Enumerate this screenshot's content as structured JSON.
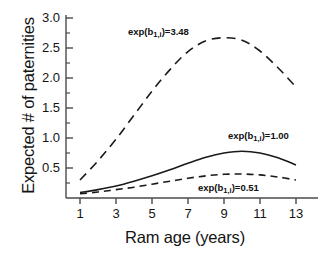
{
  "chart_data": {
    "type": "line",
    "title": "",
    "xlabel": "Ram age (years)",
    "ylabel": "Expected # of paternities",
    "xlim": [
      0.6,
      13.6
    ],
    "ylim": [
      0,
      3.0
    ],
    "xticks": [
      1,
      3,
      5,
      7,
      9,
      11,
      13
    ],
    "xtick_labels": [
      "1",
      "3",
      "5",
      "7",
      "9",
      "11",
      "13"
    ],
    "yticks": [
      0.5,
      1.0,
      1.5,
      2.0,
      2.5,
      3.0
    ],
    "ytick_labels": [
      "0.5",
      "1.0",
      "1.5",
      "2.0",
      "2.5",
      "3.0"
    ],
    "minor_yticks": [
      0.25,
      0.75,
      1.25,
      1.75,
      2.25,
      2.75
    ],
    "grid": false,
    "legend": "none",
    "annotations_inline": true,
    "x": [
      1,
      2,
      3,
      4,
      5,
      6,
      7,
      8,
      9,
      10,
      11,
      12,
      13
    ],
    "series": [
      {
        "name": "exp(b1,i)=3.48",
        "label_base": "exp(b",
        "label_sub": "1,i",
        "label_tail": ")=3.48",
        "style": "dashed",
        "dash": "9,6",
        "color": "#1a1a1a",
        "width": 1.6,
        "values": [
          0.3,
          0.62,
          0.98,
          1.38,
          1.78,
          2.14,
          2.44,
          2.62,
          2.67,
          2.63,
          2.45,
          2.17,
          1.85
        ]
      },
      {
        "name": "exp(b1,i)=1.00",
        "label_base": "exp(b",
        "label_sub": "1,i",
        "label_tail": ")=1.00",
        "style": "solid",
        "dash": "",
        "color": "#1a1a1a",
        "width": 1.6,
        "values": [
          0.09,
          0.14,
          0.2,
          0.28,
          0.37,
          0.47,
          0.58,
          0.68,
          0.75,
          0.78,
          0.75,
          0.67,
          0.55
        ]
      },
      {
        "name": "exp(b1,i)=0.51",
        "label_base": "exp(b",
        "label_sub": "1,i",
        "label_tail": ")=0.51",
        "style": "dashed",
        "dash": "7,5",
        "color": "#1a1a1a",
        "width": 1.6,
        "values": [
          0.07,
          0.1,
          0.14,
          0.18,
          0.23,
          0.28,
          0.33,
          0.37,
          0.395,
          0.4,
          0.385,
          0.35,
          0.3
        ]
      }
    ]
  },
  "axes": {
    "tick_color": "#1a1a1a",
    "axis_color": "#4a4a4a"
  }
}
